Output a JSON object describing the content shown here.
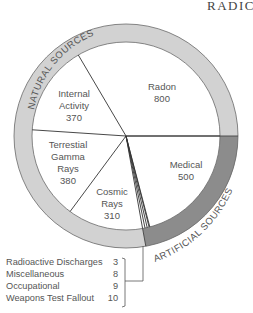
{
  "chart_data": {
    "type": "pie",
    "title_visible_text": "RADIC",
    "unit_note": "",
    "groups": [
      {
        "name": "NATURAL SOURCES",
        "members": [
          "Radon",
          "Internal Activity",
          "Terrestial Gamma Rays",
          "Cosmic Rays"
        ],
        "ring_color": "#d0d0d0"
      },
      {
        "name": "ARTIFICIAL SOURCES",
        "members": [
          "Medical",
          "Radioactive Discharges",
          "Miscellaneous",
          "Occupational",
          "Weapons Test Fallout"
        ],
        "ring_color": "#8a8a8a"
      }
    ],
    "categories": [
      "Radon",
      "Medical",
      "Radioactive Discharges",
      "Miscellaneous",
      "Occupational",
      "Weapons Test Fallout",
      "Cosmic Rays",
      "Terrestial Gamma Rays",
      "Internal Activity"
    ],
    "values": [
      800,
      500,
      3,
      8,
      9,
      10,
      310,
      380,
      370
    ],
    "slice_labels": [
      {
        "lines": [
          "Radon",
          "800"
        ]
      },
      {
        "lines": [
          "Medical",
          "500"
        ]
      },
      {
        "lines": [
          "Cosmic",
          "Rays",
          "310"
        ]
      },
      {
        "lines": [
          "Terrestial",
          "Gamma",
          "Rays",
          "380"
        ]
      },
      {
        "lines": [
          "Internal",
          "Activity",
          "370"
        ]
      }
    ],
    "callout": [
      {
        "label": "Radioactive Discharges",
        "value": "3"
      },
      {
        "label": "Miscellaneous",
        "value": "8"
      },
      {
        "label": "Occupational",
        "value": "9"
      },
      {
        "label": "Weapons Test Fallout",
        "value": "10"
      }
    ]
  },
  "labels": {
    "title": "RADIC",
    "natural": "NATURAL SOURCES",
    "artificial": "ARTIFICIAL SOURCES",
    "radon_name": "Radon",
    "radon_value": "800",
    "medical_name": "Medical",
    "medical_value": "500",
    "cosmic_1": "Cosmic",
    "cosmic_2": "Rays",
    "cosmic_value": "310",
    "terr_1": "Terrestial",
    "terr_2": "Gamma",
    "terr_3": "Rays",
    "terr_value": "380",
    "internal_1": "Internal",
    "internal_2": "Activity",
    "internal_value": "370"
  },
  "legend": [
    {
      "label": "Radioactive Discharges",
      "value": "3"
    },
    {
      "label": "Miscellaneous",
      "value": "8"
    },
    {
      "label": "Occupational",
      "value": "9"
    },
    {
      "label": "Weapons Test Fallout",
      "value": "10"
    }
  ]
}
